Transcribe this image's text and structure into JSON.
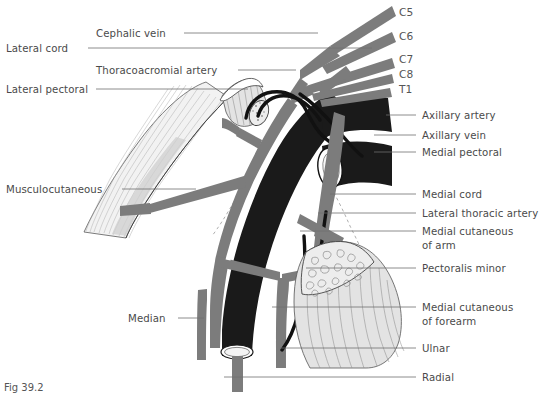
{
  "figure": {
    "caption": "Fig 39.2"
  },
  "colors": {
    "nerve": "#7c7c7c",
    "artery_dark": "#1a1a1a",
    "vein_black": "#111111",
    "muscle_light": "#f2f2f2",
    "muscle_mid": "#e3e3e3",
    "leader_line": "#6e6e6e",
    "label_text": "#4a4a4a",
    "background": "#ffffff"
  },
  "labels_left": [
    {
      "id": "lateral-cord",
      "text": "Lateral cord",
      "text_x": 6,
      "text_y": 52,
      "line_x1": 88,
      "line_x2": 372,
      "line_y": 48
    },
    {
      "id": "cephalic-vein",
      "text": "Cephalic vein",
      "text_x": 96,
      "text_y": 37,
      "line_x1": 184,
      "line_x2": 318,
      "line_y": 33
    },
    {
      "id": "thoracoacromial-artery",
      "text": "Thoracoacromial artery",
      "text_x": 96,
      "text_y": 74,
      "line_x1": 238,
      "line_x2": 296,
      "line_y": 70
    },
    {
      "id": "lateral-pectoral",
      "text": "Lateral pectoral",
      "text_x": 6,
      "text_y": 93,
      "line_x1": 96,
      "line_x2": 248,
      "line_y": 89
    },
    {
      "id": "musculocutaneous",
      "text": "Musculocutaneous",
      "text_x": 6,
      "text_y": 193,
      "line_x1": 122,
      "line_x2": 196,
      "line_y": 189
    },
    {
      "id": "median",
      "text": "Median",
      "text_x": 128,
      "text_y": 322,
      "line_x1": 178,
      "line_x2": 204,
      "line_y": 318
    }
  ],
  "labels_right": [
    {
      "id": "axillary-artery",
      "text": "Axillary artery",
      "text_x": 422,
      "text_y": 119,
      "line_x1": 386,
      "line_x2": 416,
      "line_y": 115
    },
    {
      "id": "axillary-vein",
      "text": "Axillary vein",
      "text_x": 422,
      "text_y": 139,
      "line_x1": 374,
      "line_x2": 416,
      "line_y": 135
    },
    {
      "id": "medial-pectoral",
      "text": "Medial pectoral",
      "text_x": 422,
      "text_y": 156,
      "line_x1": 374,
      "line_x2": 416,
      "line_y": 152
    },
    {
      "id": "medial-cord",
      "text": "Medial cord",
      "text_x": 422,
      "text_y": 198,
      "line_x1": 330,
      "line_x2": 416,
      "line_y": 194
    },
    {
      "id": "lateral-thoracic-artery",
      "text": "Lateral thoracic artery",
      "text_x": 422,
      "text_y": 217,
      "line_x1": 318,
      "line_x2": 416,
      "line_y": 213
    },
    {
      "id": "medial-cutaneous-of-arm-1",
      "text": "Medial cutaneous",
      "text_x": 422,
      "text_y": 235,
      "line_x1": 300,
      "line_x2": 416,
      "line_y": 231
    },
    {
      "id": "medial-cutaneous-of-arm-2",
      "text": "of arm",
      "text_x": 422,
      "text_y": 249,
      "line_x1": null,
      "line_x2": null,
      "line_y": null
    },
    {
      "id": "pectoralis-minor",
      "text": "Pectoralis minor",
      "text_x": 422,
      "text_y": 272,
      "line_x1": 306,
      "line_x2": 416,
      "line_y": 268
    },
    {
      "id": "medial-cutaneous-of-forearm-1",
      "text": "Medial cutaneous",
      "text_x": 422,
      "text_y": 311,
      "line_x1": 272,
      "line_x2": 416,
      "line_y": 307
    },
    {
      "id": "medial-cutaneous-of-forearm-2",
      "text": "of forearm",
      "text_x": 422,
      "text_y": 325,
      "line_x1": null,
      "line_x2": null,
      "line_y": null
    },
    {
      "id": "ulnar",
      "text": "Ulnar",
      "text_x": 422,
      "text_y": 352,
      "line_x1": 280,
      "line_x2": 416,
      "line_y": 348
    },
    {
      "id": "radial",
      "text": "Radial",
      "text_x": 422,
      "text_y": 381,
      "line_x1": 224,
      "line_x2": 416,
      "line_y": 377
    }
  ],
  "nerve_roots": [
    {
      "id": "c5",
      "text": "C5",
      "text_x": 399,
      "text_y": 16
    },
    {
      "id": "c6",
      "text": "C6",
      "text_x": 399,
      "text_y": 40
    },
    {
      "id": "c7",
      "text": "C7",
      "text_x": 399,
      "text_y": 63
    },
    {
      "id": "c8",
      "text": "C8",
      "text_x": 399,
      "text_y": 78
    },
    {
      "id": "t1",
      "text": "T1",
      "text_x": 399,
      "text_y": 93
    }
  ]
}
